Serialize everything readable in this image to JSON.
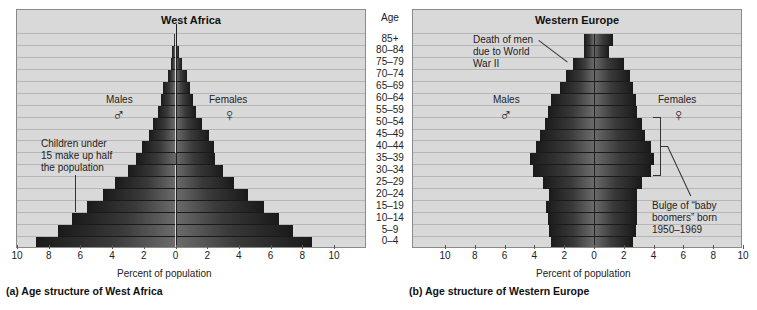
{
  "chart_data": [
    {
      "type": "bar",
      "subtype": "population-pyramid",
      "title": "West Africa",
      "caption": "(a) Age structure of West Africa",
      "xlabel": "Percent of population",
      "ylabel": "Age",
      "xlim": [
        -10,
        10
      ],
      "x_ticks": [
        "10",
        "8",
        "6",
        "4",
        "2",
        "0",
        "2",
        "4",
        "6",
        "8",
        "10"
      ],
      "categories": [
        "85+",
        "80–84",
        "75–79",
        "70–74",
        "65–69",
        "60–64",
        "55–59",
        "50–54",
        "45–49",
        "40–44",
        "35–39",
        "30–34",
        "25–29",
        "20–24",
        "15–19",
        "10–14",
        "5–9",
        "0–4"
      ],
      "series": [
        {
          "name": "Males",
          "values": [
            0.1,
            0.2,
            0.3,
            0.5,
            0.8,
            0.9,
            1.1,
            1.4,
            1.7,
            2.1,
            2.5,
            3.0,
            3.8,
            4.6,
            5.6,
            6.5,
            7.4,
            8.8
          ]
        },
        {
          "name": "Females",
          "values": [
            0.1,
            0.2,
            0.4,
            0.7,
            0.9,
            1.1,
            1.3,
            1.7,
            2.1,
            2.4,
            2.5,
            3.0,
            3.7,
            4.6,
            5.6,
            6.5,
            7.4,
            8.6
          ]
        }
      ],
      "legend": {
        "males_label": "Males",
        "females_label": "Females",
        "males_symbol": "♂",
        "females_symbol": "♀"
      },
      "annotations": [
        {
          "text": "Children under 15 make up half the population",
          "target": "10–14"
        }
      ],
      "grid": true
    },
    {
      "type": "bar",
      "subtype": "population-pyramid",
      "title": "Western Europe",
      "caption": "(b) Age structure of Western Europe",
      "xlabel": "Percent of population",
      "ylabel": "Age",
      "xlim": [
        -10,
        10
      ],
      "x_ticks": [
        "10",
        "8",
        "6",
        "4",
        "2",
        "0",
        "2",
        "4",
        "6",
        "8",
        "10"
      ],
      "categories": [
        "85+",
        "80–84",
        "75–79",
        "70–74",
        "65–69",
        "60–64",
        "55–59",
        "50–54",
        "45–49",
        "40–44",
        "35–39",
        "30–34",
        "25–29",
        "20–24",
        "15–19",
        "10–14",
        "5–9",
        "0–4"
      ],
      "series": [
        {
          "name": "Males",
          "values": [
            0.7,
            0.7,
            1.4,
            1.9,
            2.3,
            2.9,
            3.1,
            3.3,
            3.6,
            3.9,
            4.3,
            4.1,
            3.4,
            3.0,
            3.2,
            3.1,
            3.0,
            2.9
          ]
        },
        {
          "name": "Females",
          "values": [
            1.3,
            1.0,
            2.0,
            2.4,
            2.6,
            2.8,
            2.9,
            3.2,
            3.4,
            3.8,
            4.0,
            3.8,
            3.2,
            2.9,
            2.9,
            2.9,
            2.8,
            2.6
          ]
        }
      ],
      "legend": {
        "males_label": "Males",
        "females_label": "Females",
        "males_symbol": "♂",
        "females_symbol": "♀"
      },
      "annotations": [
        {
          "text": "Death of men due to World War II",
          "target": "75–79"
        },
        {
          "text": "Bulge of “baby boomers” born 1950–1969",
          "target": "30–54"
        }
      ],
      "grid": true
    }
  ],
  "age_column": {
    "header": "Age"
  },
  "annotations": {
    "west_africa_children": [
      "Children under",
      "15 make up half",
      "the population"
    ],
    "europe_ww2": [
      "Death of men",
      "due to World",
      "War II"
    ],
    "europe_boomers": [
      "Bulge of “baby",
      "boomers” born",
      "1950–1969"
    ]
  },
  "colors": {
    "panel_bg": "#d9d9d9",
    "bar_dark": "#1e1e1e",
    "bar_mid": "#6a6a6a",
    "grid": "#b5b5b5"
  }
}
